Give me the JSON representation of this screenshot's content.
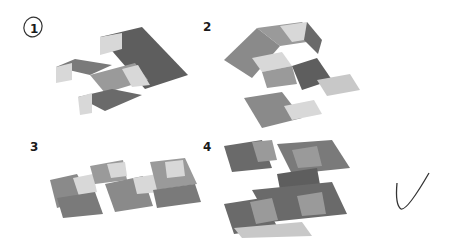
{
  "options": [
    {
      "label": "1",
      "circled": true
    },
    {
      "label": "2",
      "circled": false
    },
    {
      "label": "3",
      "circled": false
    },
    {
      "label": "4",
      "circled": false
    }
  ],
  "annotations": {
    "checkmark_near": "4"
  },
  "colors": {
    "top_light": "#d8d8d8",
    "top_mid": "#b0b0b0",
    "left_face": "#9a9a9a",
    "right_face": "#7a7a7a",
    "dark_face": "#5e5e5e",
    "ink": "#222222"
  }
}
